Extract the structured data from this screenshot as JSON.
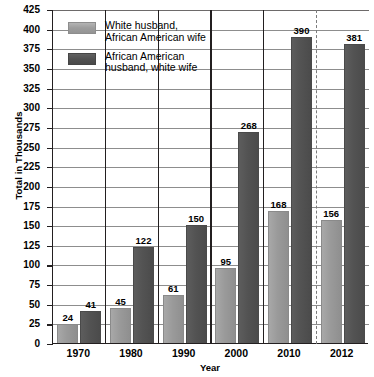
{
  "chart_data": {
    "type": "bar",
    "title": "",
    "xlabel": "Year",
    "ylabel": "Total in Thousands",
    "categories": [
      "1970",
      "1980",
      "1990",
      "2000",
      "2010",
      "2012"
    ],
    "series": [
      {
        "name": "White husband,\nAfrican American wife",
        "color": "#9a9a9a",
        "values": [
          24,
          45,
          61,
          95,
          168,
          156
        ]
      },
      {
        "name": "African American\nhusband, white wife",
        "color": "#535353",
        "values": [
          41,
          122,
          150,
          268,
          390,
          381
        ]
      }
    ],
    "ylim": [
      0,
      425
    ],
    "ytick_step": 25,
    "yticks": [
      "0",
      "25",
      "50",
      "75",
      "100",
      "125",
      "150",
      "175",
      "200",
      "225",
      "250",
      "275",
      "300",
      "325",
      "350",
      "375",
      "400",
      "425"
    ],
    "grid": true,
    "legend_position": "top-left-inside",
    "annotations": [
      {
        "type": "dashed-vertical-divider",
        "between": [
          "2010",
          "2012"
        ]
      }
    ],
    "data_labels": true
  },
  "legend": {
    "items": [
      {
        "label": "White husband,\nAfrican American wife",
        "swatch": "light"
      },
      {
        "label": "African American\nhusband, white wife",
        "swatch": "dark"
      }
    ]
  }
}
